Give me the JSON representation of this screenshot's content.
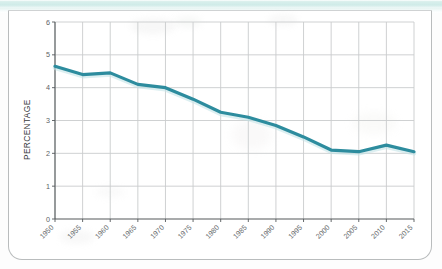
{
  "card": {
    "top_band_color": "#cfebe8",
    "border_color": "#b9bcbd",
    "background": "#ffffff"
  },
  "chart_data": {
    "type": "line",
    "title": "",
    "xlabel": "",
    "ylabel": "PERCENTAGE",
    "x": [
      1950,
      1955,
      1960,
      1965,
      1970,
      1975,
      1980,
      1985,
      1990,
      1995,
      2000,
      2005,
      2010,
      2015
    ],
    "categories": [
      "1950",
      "1955",
      "1960",
      "1965",
      "1970",
      "1975",
      "1980",
      "1985",
      "1990",
      "1995",
      "2000",
      "2005",
      "2010",
      "2015"
    ],
    "values": [
      4.65,
      4.4,
      4.45,
      4.1,
      4.0,
      3.65,
      3.25,
      3.1,
      2.85,
      2.5,
      2.1,
      2.05,
      2.25,
      2.05
    ],
    "series": [
      {
        "name": "Percentage",
        "color": "#2d8c9e",
        "values": [
          4.65,
          4.4,
          4.45,
          4.1,
          4.0,
          3.65,
          3.25,
          3.1,
          2.85,
          2.5,
          2.1,
          2.05,
          2.25,
          2.05
        ]
      }
    ],
    "ylim": [
      0,
      6
    ],
    "yticks": [
      0,
      1,
      2,
      3,
      4,
      5,
      6
    ],
    "ytick_labels": [
      "0",
      "1",
      "2",
      "3",
      "4",
      "5",
      "6"
    ],
    "xlim": [
      1950,
      2015
    ],
    "grid": true,
    "grid_color": "#c9cccd",
    "legend": "none",
    "line_width": 3.2,
    "markers": false,
    "xtick_label_rotation": -45
  }
}
